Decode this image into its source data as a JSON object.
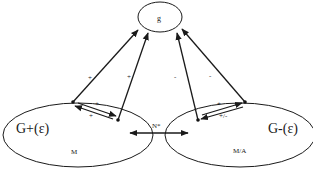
{
  "nodes": {
    "top": {
      "label": "g"
    },
    "left": {
      "label": "G+(ε)",
      "sublabel": "M"
    },
    "right": {
      "label": "G-(ε)",
      "sublabel": "M/A"
    }
  },
  "edges": {
    "left_outer_to_g": {
      "sign": "+"
    },
    "left_inner_to_g": {
      "sign": "+"
    },
    "right_inner_to_g": {
      "sign": "-"
    },
    "right_outer_to_g": {
      "sign": "-"
    },
    "left_internal_upper": {
      "sign": "+"
    },
    "left_internal_lower": {
      "sign": "+"
    },
    "right_internal_upper": {
      "sign": "+"
    },
    "right_internal_lower": {
      "sign": "+/-"
    },
    "between": {
      "label": "N*"
    }
  },
  "colors": {
    "stroke": "#1a1a1a",
    "background": "#ffffff"
  }
}
